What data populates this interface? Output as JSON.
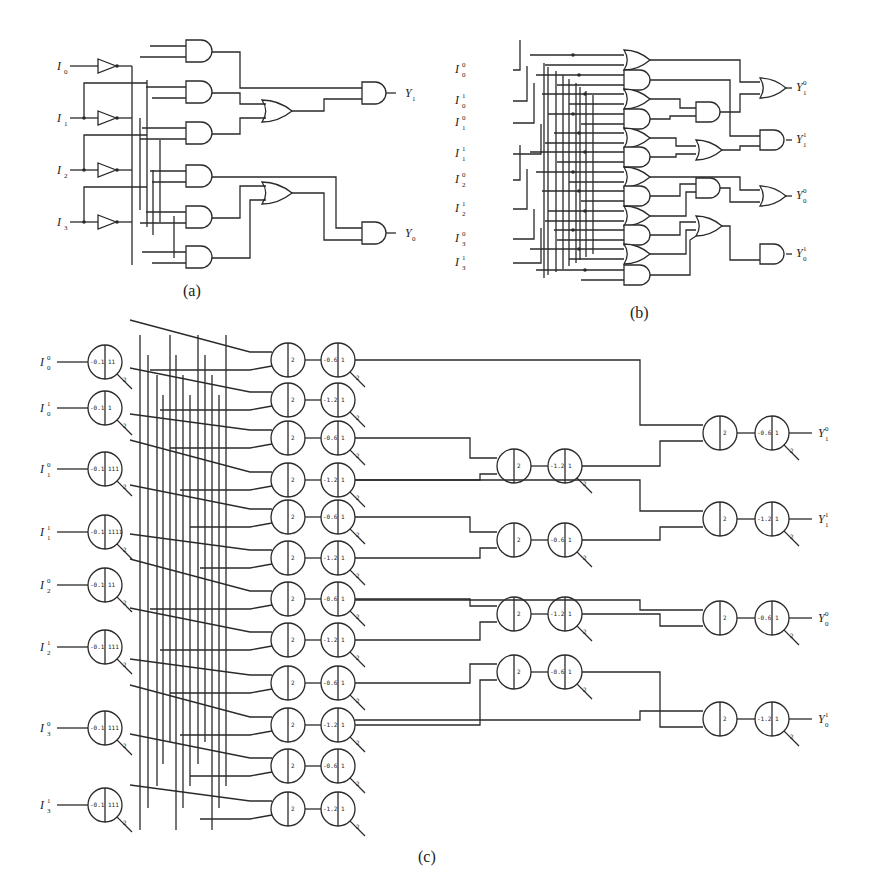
{
  "figure": {
    "panels": [
      {
        "id": "a",
        "caption": "(a)",
        "type": "logic-circuit",
        "inputs": [
          "I0",
          "I1",
          "I2",
          "I3"
        ],
        "input_labels": [
          {
            "base": "I",
            "sub": "0"
          },
          {
            "base": "I",
            "sub": "1"
          },
          {
            "base": "I",
            "sub": "2"
          },
          {
            "base": "I",
            "sub": "3"
          }
        ],
        "buffers": 4,
        "and_gates_first_layer": 6,
        "or_gates": 2,
        "and_gates_output": 2,
        "outputs": [
          {
            "base": "Y",
            "sub": "1"
          },
          {
            "base": "Y",
            "sub": "0"
          }
        ]
      },
      {
        "id": "b",
        "caption": "(b)",
        "type": "dual-rail-logic-circuit",
        "input_labels": [
          {
            "base": "I",
            "sub": "0",
            "sup": "0"
          },
          {
            "base": "I",
            "sub": "0",
            "sup": "1"
          },
          {
            "base": "I",
            "sub": "1",
            "sup": "0"
          },
          {
            "base": "I",
            "sub": "1",
            "sup": "1"
          },
          {
            "base": "I",
            "sub": "2",
            "sup": "0"
          },
          {
            "base": "I",
            "sub": "2",
            "sup": "1"
          },
          {
            "base": "I",
            "sub": "3",
            "sup": "0"
          },
          {
            "base": "I",
            "sub": "3",
            "sup": "1"
          }
        ],
        "first_layer_gates": [
          "OR",
          "AND",
          "OR",
          "AND",
          "OR",
          "AND",
          "OR",
          "AND",
          "OR",
          "AND",
          "OR",
          "AND"
        ],
        "second_layer_gates": [
          "AND",
          "OR",
          "AND",
          "OR"
        ],
        "output_gates": [
          "OR",
          "AND",
          "OR",
          "AND"
        ],
        "output_labels": [
          {
            "base": "Y",
            "sub": "1",
            "sup": "0"
          },
          {
            "base": "Y",
            "sub": "1",
            "sup": "1"
          },
          {
            "base": "Y",
            "sub": "0",
            "sup": "0"
          },
          {
            "base": "Y",
            "sub": "0",
            "sup": "1"
          }
        ]
      },
      {
        "id": "c",
        "caption": "(c)",
        "type": "threshold-neuron-network",
        "input_labels": [
          {
            "base": "I",
            "sub": "0",
            "sup": "0"
          },
          {
            "base": "I",
            "sub": "0",
            "sup": "1"
          },
          {
            "base": "I",
            "sub": "1",
            "sup": "0"
          },
          {
            "base": "I",
            "sub": "1",
            "sup": "1"
          },
          {
            "base": "I",
            "sub": "2",
            "sup": "0"
          },
          {
            "base": "I",
            "sub": "2",
            "sup": "1"
          },
          {
            "base": "I",
            "sub": "3",
            "sup": "0"
          },
          {
            "base": "I",
            "sub": "3",
            "sup": "1"
          }
        ],
        "input_neurons": [
          {
            "threshold": "-0.1",
            "weights": [
              "1",
              "1"
            ],
            "self": "2"
          },
          {
            "threshold": "-0.1",
            "weights": [
              "1"
            ],
            "self": "2"
          },
          {
            "threshold": "-0.1",
            "weights": [
              "1",
              "1",
              "1"
            ],
            "self": "2"
          },
          {
            "threshold": "-0.1",
            "weights": [
              "1",
              "1",
              "1",
              "1"
            ],
            "self": "2"
          },
          {
            "threshold": "-0.1",
            "weights": [
              "1",
              "1"
            ],
            "self": "2"
          },
          {
            "threshold": "-0.1",
            "weights": [
              "1",
              "1",
              "1"
            ],
            "self": "2"
          },
          {
            "threshold": "-0.1",
            "weights": [
              "1",
              "1",
              "1"
            ],
            "self": "2"
          },
          {
            "threshold": "-0.1",
            "weights": [
              "1",
              "1",
              "1"
            ],
            "self": "2"
          }
        ],
        "sum_neurons_layer1": [
          "2",
          "2",
          "2",
          "2",
          "2",
          "2",
          "2",
          "2",
          "2",
          "2",
          "2",
          "2"
        ],
        "threshold_neurons_layer1": [
          {
            "threshold": "-0.6",
            "out": "1",
            "self": "2"
          },
          {
            "threshold": "-1.2",
            "out": "1",
            "self": "2"
          },
          {
            "threshold": "-0.6",
            "out": "1",
            "self": "2"
          },
          {
            "threshold": "-1.2",
            "out": "1",
            "self": "2"
          },
          {
            "threshold": "-0.6",
            "out": "1",
            "self": "2"
          },
          {
            "threshold": "-1.2",
            "out": "1",
            "self": "2"
          },
          {
            "threshold": "-0.6",
            "out": "1",
            "self": "2"
          },
          {
            "threshold": "-1.2",
            "out": "1",
            "self": "2"
          },
          {
            "threshold": "-0.6",
            "out": "1",
            "self": "2"
          },
          {
            "threshold": "-1.2",
            "out": "1",
            "self": "2"
          },
          {
            "threshold": "-0.6",
            "out": "1",
            "self": "2"
          },
          {
            "threshold": "-1.2",
            "out": "1",
            "self": "2"
          }
        ],
        "sum_neurons_layer2": [
          "2",
          "2",
          "2",
          "2"
        ],
        "threshold_neurons_layer2": [
          {
            "threshold": "-1.2",
            "out": "1",
            "self": "2"
          },
          {
            "threshold": "-0.6",
            "out": "1",
            "self": "2"
          },
          {
            "threshold": "-1.2",
            "out": "1",
            "self": "2"
          },
          {
            "threshold": "-0.6",
            "out": "1",
            "self": "2"
          }
        ],
        "sum_neurons_output": [
          "2",
          "2",
          "2",
          "2"
        ],
        "threshold_neurons_output": [
          {
            "threshold": "-0.6",
            "out": "1",
            "self": "2"
          },
          {
            "threshold": "-1.2",
            "out": "1",
            "self": "2"
          },
          {
            "threshold": "-0.6",
            "out": "1",
            "self": "2"
          },
          {
            "threshold": "-1.2",
            "out": "1",
            "self": "2"
          }
        ],
        "output_labels": [
          {
            "base": "Y",
            "sub": "1",
            "sup": "0"
          },
          {
            "base": "Y",
            "sub": "1",
            "sup": "1"
          },
          {
            "base": "Y",
            "sub": "0",
            "sup": "0"
          },
          {
            "base": "Y",
            "sub": "0",
            "sup": "1"
          }
        ]
      }
    ]
  }
}
